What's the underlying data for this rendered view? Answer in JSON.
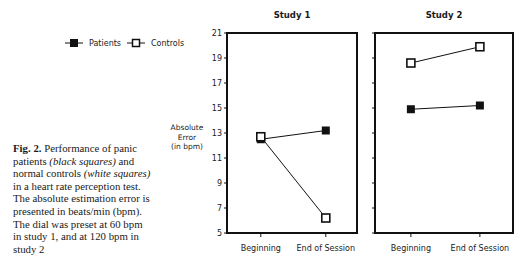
{
  "legend": {
    "patients_label": "Patients",
    "controls_label": "Controls"
  },
  "y_axis_label": [
    "Absolute",
    "Error",
    "(in bpm)"
  ],
  "caption": {
    "fig_label": "Fig. 2.",
    "text_1": " Performance of panic patients ",
    "italic_1": "(black squares)",
    "text_2": " and normal controls ",
    "italic_2": "(white squares)",
    "text_3": " in a heart rate perception test. The absolute estimation error is presented in beats/min (bpm). The dial was preset at 60 bpm in study 1, and at 120 bpm in study 2"
  },
  "chart_data": [
    {
      "type": "line",
      "title": "Study 1",
      "xlabel": "",
      "ylabel": "Absolute Error (in bpm)",
      "categories": [
        "Beginning",
        "End of Session"
      ],
      "ylim": [
        5,
        21
      ],
      "yticks": [
        5,
        7,
        9,
        11,
        13,
        15,
        17,
        19,
        21
      ],
      "series": [
        {
          "name": "Patients",
          "marker": "filled-square",
          "values": [
            12.5,
            13.2
          ]
        },
        {
          "name": "Controls",
          "marker": "open-square",
          "values": [
            12.7,
            6.2
          ]
        }
      ],
      "grid": false,
      "legend_position": "top-left (outside)"
    },
    {
      "type": "line",
      "title": "Study 2",
      "xlabel": "",
      "ylabel": "Absolute Error (in bpm)",
      "categories": [
        "Beginning",
        "End of Session"
      ],
      "ylim": [
        5,
        21
      ],
      "yticks": [
        5,
        7,
        9,
        11,
        13,
        15,
        17,
        19,
        21
      ],
      "series": [
        {
          "name": "Patients",
          "marker": "filled-square",
          "values": [
            14.9,
            15.2
          ]
        },
        {
          "name": "Controls",
          "marker": "open-square",
          "values": [
            18.6,
            19.9
          ]
        }
      ],
      "grid": false,
      "legend_position": "shared"
    }
  ]
}
